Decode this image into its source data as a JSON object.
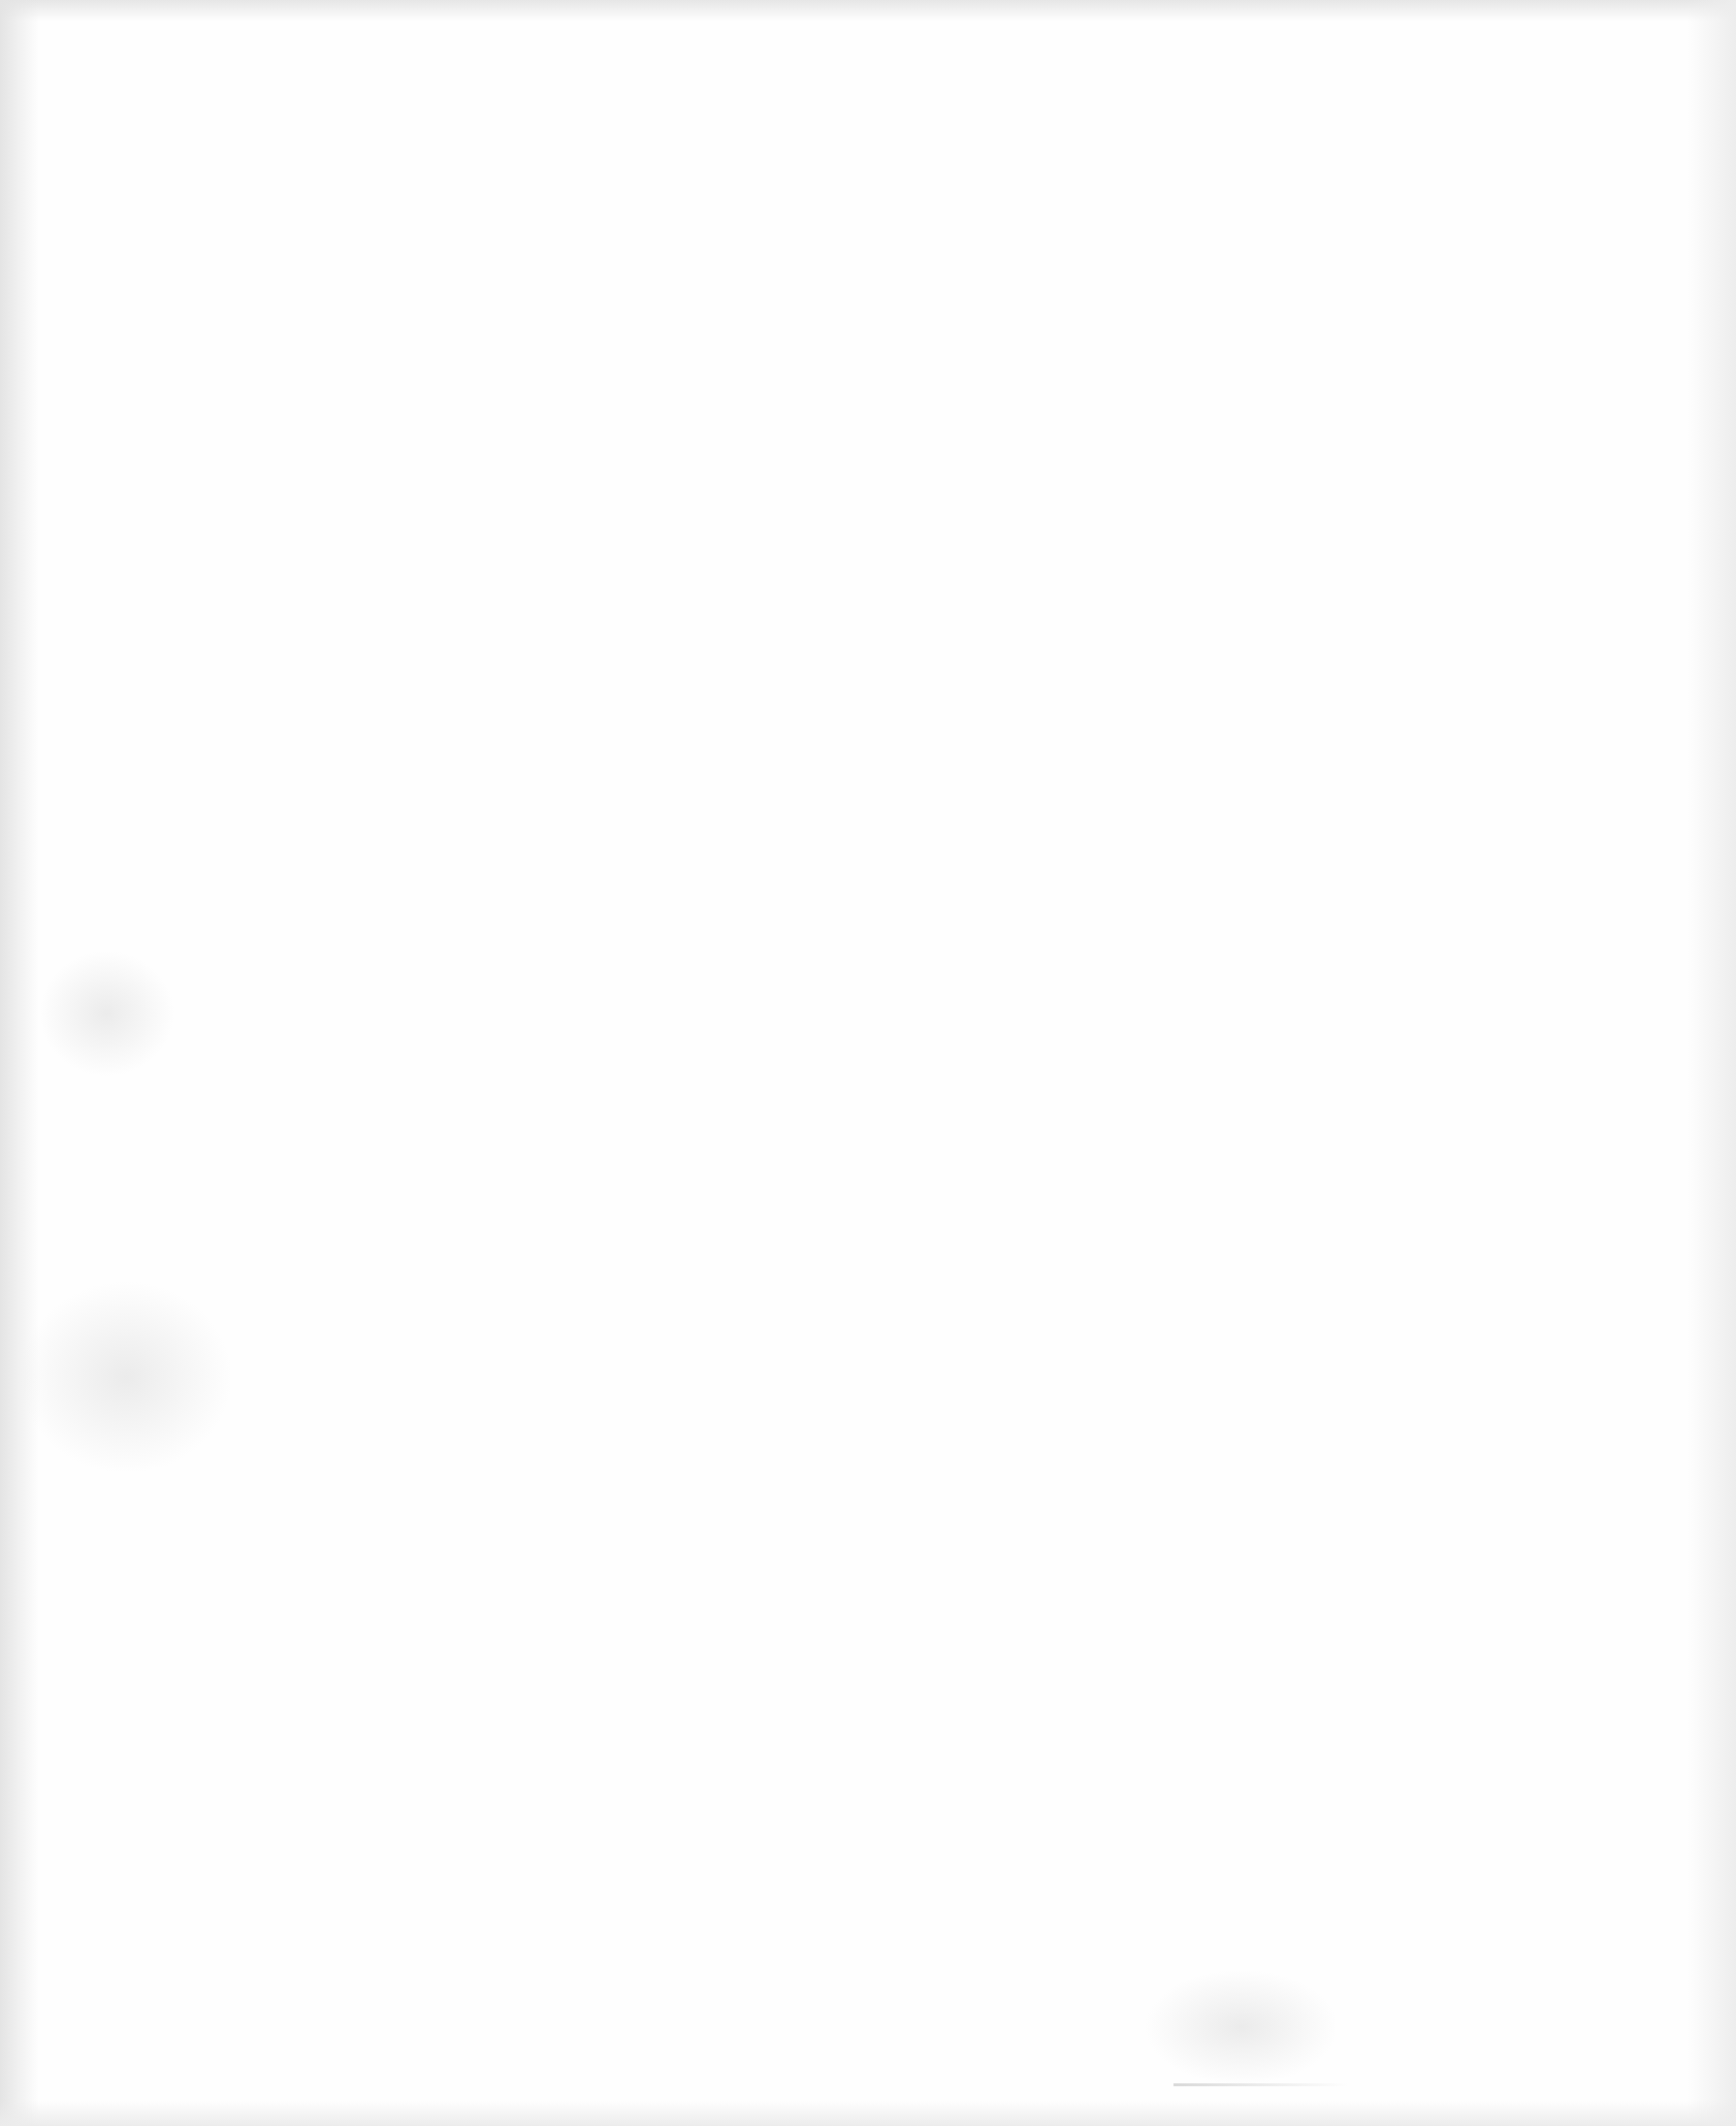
{
  "document": {
    "type": "blank-scanned-page",
    "text": ""
  }
}
